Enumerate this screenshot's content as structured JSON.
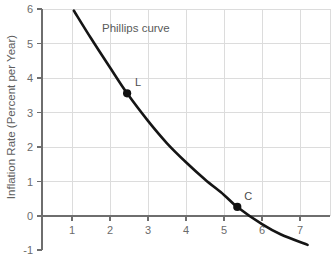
{
  "chart_data": {
    "type": "line",
    "title": "",
    "annotation": "Phillips curve",
    "xlabel": "",
    "ylabel": "Inflation Rate (Percent per Year)",
    "xlim": [
      0.3,
      7.7
    ],
    "ylim": [
      -1,
      6
    ],
    "xticks": [
      1,
      2,
      3,
      4,
      5,
      6,
      7
    ],
    "xtick_labels": [
      "1",
      "2",
      "3",
      "4",
      "5",
      "6",
      "7"
    ],
    "yticks": [
      -1,
      0,
      1,
      2,
      3,
      4,
      5,
      6
    ],
    "ytick_labels": [
      "-1",
      "0",
      "1",
      "2",
      "3",
      "4",
      "5",
      "6"
    ],
    "grid": true,
    "legend": "none",
    "series": [
      {
        "name": "Phillips curve",
        "x": [
          1.05,
          1.5,
          2.0,
          2.45,
          3.0,
          3.5,
          4.0,
          4.5,
          5.0,
          5.35,
          6.0,
          6.5,
          7.2
        ],
        "y": [
          5.95,
          5.15,
          4.3,
          3.55,
          2.75,
          2.1,
          1.55,
          1.05,
          0.6,
          0.25,
          -0.25,
          -0.55,
          -0.85
        ]
      }
    ],
    "points": [
      {
        "label": "L",
        "x": 2.45,
        "y": 3.55
      },
      {
        "label": "C",
        "x": 5.35,
        "y": 0.25
      }
    ]
  }
}
